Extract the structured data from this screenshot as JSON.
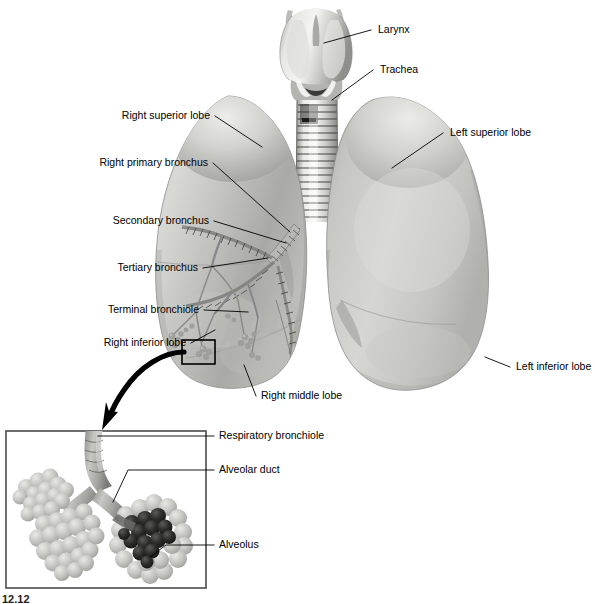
{
  "figure": {
    "background_color": "#ffffff",
    "line_color": "#000000",
    "inset_border_color": "#4a4a4a",
    "caption_fragment": "12.12"
  },
  "labels": {
    "larynx": "Larynx",
    "trachea": "Trachea",
    "right_superior_lobe": "Right superior lobe",
    "left_superior_lobe": "Left superior lobe",
    "right_primary_bronchus": "Right primary bronchus",
    "secondary_bronchus": "Secondary bronchus",
    "tertiary_bronchus": "Tertiary bronchus",
    "terminal_bronchiole": "Terminal bronchiole",
    "right_inferior_lobe": "Right inferior lobe",
    "right_middle_lobe": "Right middle lobe",
    "left_inferior_lobe": "Left inferior lobe",
    "respiratory_bronchiole": "Respiratory bronchiole",
    "alveolar_duct": "Alveolar duct",
    "alveolus": "Alveolus"
  },
  "structures": {
    "larynx": "larynx-illustration",
    "trachea": "trachea-illustration",
    "right_lung": "right-lung-illustration",
    "left_lung": "left-lung-illustration",
    "bronchial_tree": "bronchial-tree-illustration",
    "detail_box": "detail-selection-rectangle",
    "magnify_arrow": "magnification-arrow",
    "inset_panel": "alveoli-inset-panel",
    "alveolar_sacs": "alveolar-sac-cluster",
    "capillary_network": "capillary-network"
  }
}
